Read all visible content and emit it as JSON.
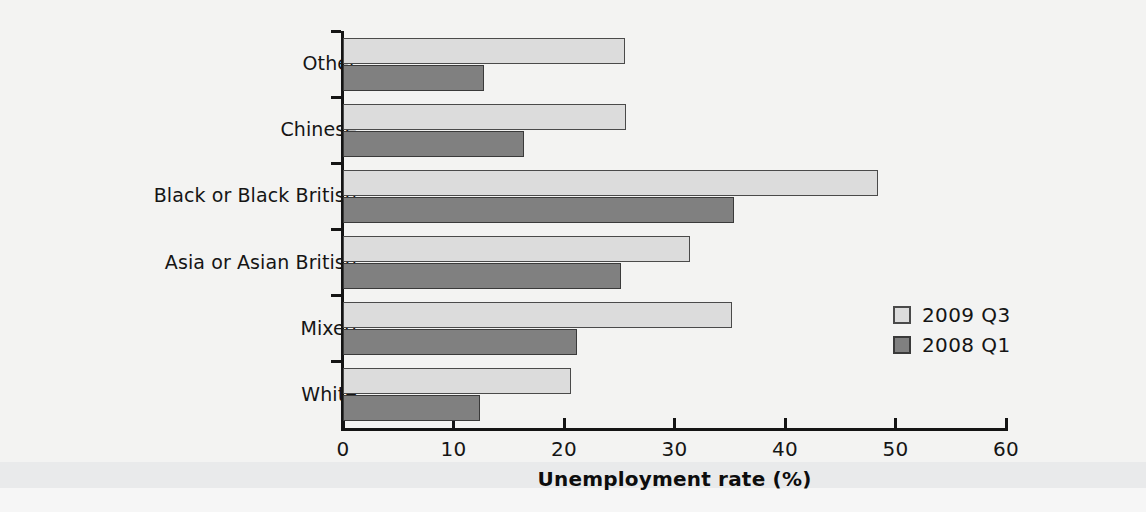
{
  "chart_data": {
    "type": "bar",
    "orientation": "horizontal",
    "title": "",
    "xlabel": "Unemployment rate (%)",
    "ylabel": "",
    "xlim": [
      0,
      60
    ],
    "xticks": [
      0,
      10,
      20,
      30,
      40,
      50,
      60
    ],
    "xtick_labels": [
      "0",
      "10",
      "20",
      "30",
      "40",
      "50",
      "60"
    ],
    "grid": false,
    "categories": [
      "White",
      "Mixed",
      "Asia or Asian British",
      "Black or Black British",
      "Chinese",
      "Other"
    ],
    "series": [
      {
        "name": "2009 Q3",
        "color": "#dcdcdc",
        "values": [
          20.6,
          35.2,
          31.4,
          48.4,
          25.6,
          25.5
        ]
      },
      {
        "name": "2008 Q1",
        "color": "#808080",
        "values": [
          12.4,
          21.2,
          25.2,
          35.4,
          16.4,
          12.8
        ]
      }
    ],
    "legend": {
      "position": "right-middle",
      "entries": [
        {
          "label": "2009 Q3",
          "color": "#dcdcdc"
        },
        {
          "label": "2008 Q1",
          "color": "#808080"
        }
      ]
    }
  },
  "colors": {
    "background": "#f3f3f2",
    "axis": "#141414",
    "series_2009": "#dcdcdc",
    "series_2008": "#808080",
    "bar_outline": "#4a4a4a"
  }
}
